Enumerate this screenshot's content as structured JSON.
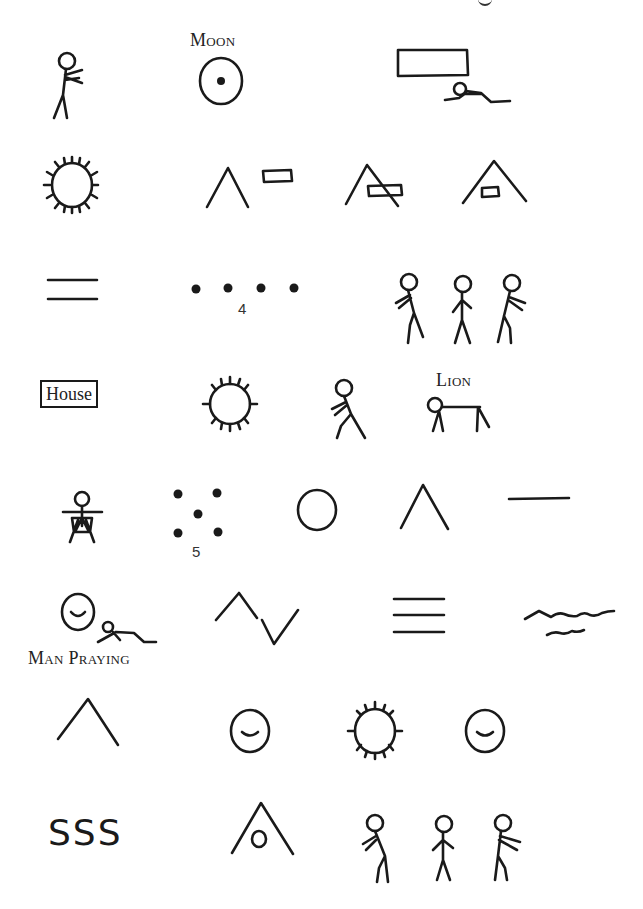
{
  "page": {
    "top_fragment": "g",
    "rows": [
      {
        "name": "row-1",
        "symbols": [
          "man-pointing",
          "moon",
          "man-under-box"
        ],
        "labels": {
          "moon": "Moon"
        }
      },
      {
        "name": "row-2",
        "symbols": [
          "sun",
          "mountain-and-box",
          "mountain-crossing-box",
          "box-inside-mountain"
        ]
      },
      {
        "name": "row-3",
        "symbols": [
          "double-line",
          "four-dots",
          "three-men-walking"
        ],
        "labels": {
          "four_dots_number": "4"
        }
      },
      {
        "name": "row-4",
        "symbols": [
          "house",
          "sun",
          "man-walking",
          "lion"
        ],
        "labels": {
          "house": "House",
          "lion": "Lion"
        }
      },
      {
        "name": "row-5",
        "symbols": [
          "man-sitting",
          "five-dots",
          "circle",
          "mountain",
          "single-line"
        ],
        "labels": {
          "five_dots_number": "5"
        }
      },
      {
        "name": "row-6",
        "symbols": [
          "man-praying",
          "zigzag",
          "triple-line",
          "water"
        ],
        "labels": {
          "man_praying": "Man Praying"
        }
      },
      {
        "name": "row-7",
        "symbols": [
          "mountain",
          "face",
          "sun",
          "face"
        ]
      },
      {
        "name": "row-8",
        "symbols": [
          "sss",
          "circle-inside-mountain",
          "three-men-walking"
        ],
        "labels": {
          "sss": "SSS"
        }
      }
    ],
    "labels": {
      "moon": "Moon",
      "four": "4",
      "house": "House",
      "lion": "Lion",
      "five": "5",
      "man_praying": "Man Praying",
      "sss": "SSS"
    }
  }
}
